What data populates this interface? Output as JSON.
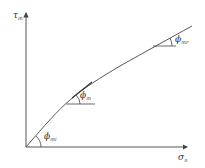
{
  "diagram": {
    "axes": {
      "y_label": "τ",
      "y_label_sub": "m",
      "x_label": "σ",
      "x_label_sub": "n"
    },
    "angles": [
      {
        "symbol": "ϕ",
        "sub": "mi"
      },
      {
        "symbol": "ϕ",
        "sub": "m"
      },
      {
        "symbol": "ϕ",
        "sub": "mr"
      }
    ],
    "colors": {
      "line": "#444444",
      "background": "#ffffff"
    }
  }
}
